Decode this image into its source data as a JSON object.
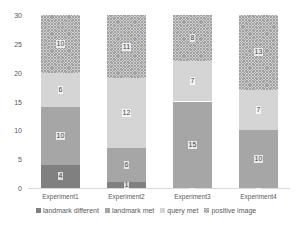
{
  "chart_data": {
    "type": "bar",
    "stacked": true,
    "title": "",
    "xlabel": "",
    "ylabel": "",
    "ylim": [
      0,
      30
    ],
    "yticks": [
      0,
      5,
      10,
      15,
      20,
      25,
      30
    ],
    "grid": false,
    "legend_position": "bottom",
    "categories": [
      "Experiment1",
      "Experiment2",
      "Experiment3",
      "Experiment4"
    ],
    "series": [
      {
        "name": "landmark different",
        "values": [
          4,
          1,
          0,
          0
        ],
        "color": "#808080"
      },
      {
        "name": "landmark met",
        "values": [
          10,
          6,
          15,
          10
        ],
        "color": "#a6a6a6"
      },
      {
        "name": "query met",
        "values": [
          6,
          12,
          7,
          7
        ],
        "color": "#e8e8e8"
      },
      {
        "name": "positive image",
        "values": [
          10,
          11,
          8,
          13
        ],
        "color": "#c8c8c8"
      }
    ]
  }
}
